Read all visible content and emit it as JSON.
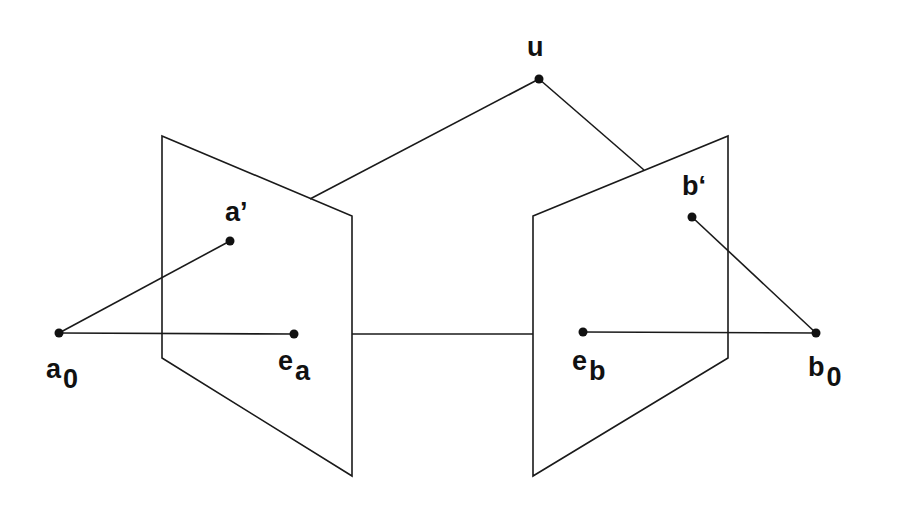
{
  "figure": {
    "stroke_color": "#1a1a1a",
    "point_color": "#111111"
  },
  "planes": [
    {
      "name": "left-image-plane",
      "points": "162,136 352,216 352,476 162,358"
    },
    {
      "name": "right-image-plane",
      "points": "533,216 728,136 728,358 533,476"
    }
  ],
  "points": {
    "a0": {
      "x": 59,
      "y": 333
    },
    "a_prime": {
      "x": 230,
      "y": 241
    },
    "e_a": {
      "x": 294,
      "y": 334
    },
    "u": {
      "x": 539,
      "y": 79
    },
    "e_b": {
      "x": 583,
      "y": 332
    },
    "b_prime": {
      "x": 692,
      "y": 217
    },
    "b0": {
      "x": 816,
      "y": 333
    }
  },
  "labels": {
    "u": {
      "main": "u",
      "sub": ""
    },
    "a_prime": {
      "main": "a’",
      "sub": ""
    },
    "b_prime": {
      "main": "b‘",
      "sub": ""
    },
    "a0": {
      "main": "a",
      "sub": "0"
    },
    "e_a": {
      "main": "e",
      "sub": "a"
    },
    "e_b": {
      "main": "e",
      "sub": "b"
    },
    "b0": {
      "main": "b",
      "sub": "0"
    }
  }
}
